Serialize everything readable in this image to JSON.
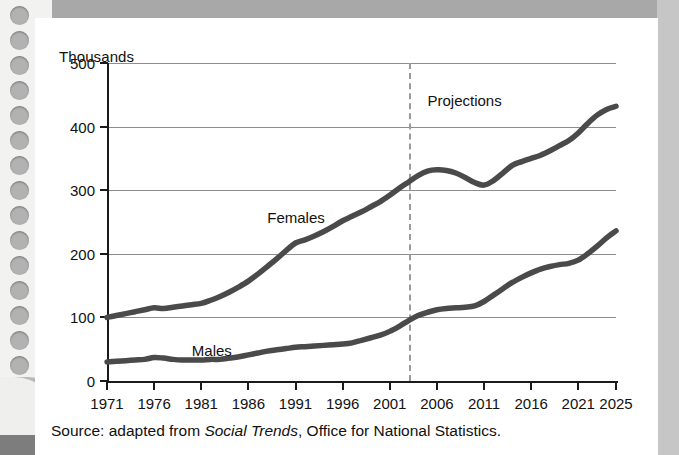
{
  "figure": {
    "y_axis_title": "Thousands",
    "projections_label": "Projections",
    "source_note_prefix": "Source: adapted from ",
    "source_note_italic": "Social Trends",
    "source_note_suffix": ", Office for National Statistics."
  },
  "colors": {
    "series_line": "#4a4a4a",
    "axis": "#1a1a1a",
    "gridline": "#8d8d8d",
    "projection_divider": "#9a9a9a",
    "card_background": "#ffffff",
    "page_background": "#cfcfcf"
  },
  "chart_data": {
    "type": "line",
    "title": "",
    "subtitle": "",
    "xlabel": "",
    "ylabel": "Thousands",
    "xlim": [
      1971,
      2025
    ],
    "ylim": [
      0,
      500
    ],
    "ytick_values": [
      0,
      100,
      200,
      300,
      400,
      500
    ],
    "ytick_labels": [
      "0",
      "100",
      "200",
      "300",
      "400",
      "500"
    ],
    "xtick_values": [
      1971,
      1976,
      1981,
      1986,
      1991,
      1996,
      2001,
      2006,
      2011,
      2016,
      2021,
      2025
    ],
    "xtick_labels": [
      "1971",
      "1976",
      "1981",
      "1986",
      "1991",
      "1996",
      "2001",
      "2006",
      "2011",
      "2016",
      "2021",
      "2025"
    ],
    "grid": "horizontal",
    "legend": "inline-labels",
    "annotations": [
      {
        "text": "Projections",
        "x": 2005,
        "y": 455
      },
      {
        "text": "Females",
        "x": 1988,
        "y": 270
      },
      {
        "text": "Males",
        "x": 1980,
        "y": 62
      }
    ],
    "projection_start_year": 2003,
    "x": [
      1971,
      1972,
      1973,
      1974,
      1975,
      1976,
      1977,
      1978,
      1979,
      1980,
      1981,
      1982,
      1983,
      1984,
      1985,
      1986,
      1987,
      1988,
      1989,
      1990,
      1991,
      1992,
      1993,
      1994,
      1995,
      1996,
      1997,
      1998,
      1999,
      2000,
      2001,
      2002,
      2003,
      2004,
      2005,
      2006,
      2007,
      2008,
      2009,
      2010,
      2011,
      2012,
      2013,
      2014,
      2015,
      2016,
      2017,
      2018,
      2019,
      2020,
      2021,
      2022,
      2023,
      2024,
      2025
    ],
    "series": [
      {
        "name": "Females",
        "values": [
          100,
          103,
          106,
          109,
          112,
          115,
          114,
          116,
          118,
          120,
          122,
          127,
          133,
          140,
          148,
          157,
          168,
          180,
          192,
          205,
          217,
          222,
          228,
          235,
          243,
          252,
          259,
          266,
          274,
          282,
          292,
          303,
          313,
          323,
          330,
          332,
          331,
          327,
          320,
          312,
          308,
          315,
          327,
          339,
          345,
          350,
          355,
          362,
          370,
          378,
          390,
          405,
          418,
          427,
          432
        ]
      },
      {
        "name": "Males",
        "values": [
          30,
          31,
          32,
          33,
          34,
          37,
          36,
          34,
          33,
          33,
          33,
          34,
          34,
          36,
          38,
          41,
          44,
          47,
          49,
          51,
          53,
          54,
          55,
          56,
          57,
          58,
          60,
          64,
          68,
          72,
          78,
          86,
          95,
          103,
          108,
          112,
          114,
          115,
          116,
          118,
          125,
          135,
          145,
          155,
          163,
          170,
          176,
          180,
          183,
          185,
          190,
          200,
          212,
          225,
          236
        ]
      }
    ]
  }
}
